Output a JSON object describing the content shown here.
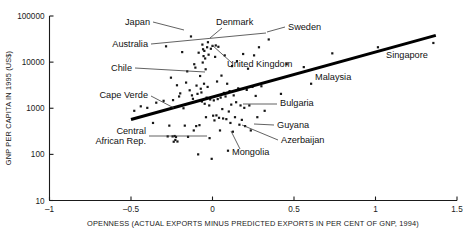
{
  "chart_data": {
    "type": "scatter",
    "title": "",
    "xlabel": "OPENNESS (ACTUAL EXPORTS MINUS PREDICTED EXPORTS IN PER CENT OF GNP, 1994)",
    "ylabel": "GNP PER CAPITA IN 1995 (US$)",
    "xlim": [
      -1,
      1.5
    ],
    "ylim": [
      10,
      100000
    ],
    "yscale": "log",
    "xscale": "linear",
    "grid": false,
    "legend": "none",
    "xticks": [
      -1,
      -0.5,
      0,
      0.5,
      1,
      1.5
    ],
    "xticklabels": [
      "–1",
      "–0.5",
      "0",
      "0.5",
      "1",
      "1.5"
    ],
    "yticks": [
      10,
      100,
      1000,
      10000,
      100000
    ],
    "yticklabels": [
      "10",
      "100",
      "1000",
      "10000",
      "100000"
    ],
    "trendline": {
      "x0": -0.5,
      "y0": 570,
      "x1": 1.37,
      "y1": 38000
    },
    "points": [
      {
        "x": -0.48,
        "y": 880
      },
      {
        "x": -0.44,
        "y": 1100
      },
      {
        "x": -0.4,
        "y": 1020
      },
      {
        "x": -0.365,
        "y": 480
      },
      {
        "x": -0.345,
        "y": 1320
      },
      {
        "x": -0.3,
        "y": 1450
      },
      {
        "x": -0.285,
        "y": 22000
      },
      {
        "x": -0.275,
        "y": 245
      },
      {
        "x": -0.265,
        "y": 420
      },
      {
        "x": -0.255,
        "y": 4600
      },
      {
        "x": -0.245,
        "y": 245
      },
      {
        "x": -0.242,
        "y": 1500
      },
      {
        "x": -0.238,
        "y": 188
      },
      {
        "x": -0.232,
        "y": 250
      },
      {
        "x": -0.228,
        "y": 205
      },
      {
        "x": -0.224,
        "y": 238
      },
      {
        "x": -0.218,
        "y": 3150
      },
      {
        "x": -0.215,
        "y": 190
      },
      {
        "x": -0.205,
        "y": 1800
      },
      {
        "x": -0.198,
        "y": 2100
      },
      {
        "x": -0.186,
        "y": 16500
      },
      {
        "x": -0.178,
        "y": 1000
      },
      {
        "x": -0.17,
        "y": 420
      },
      {
        "x": -0.162,
        "y": 3600
      },
      {
        "x": -0.155,
        "y": 6300
      },
      {
        "x": -0.15,
        "y": 240
      },
      {
        "x": -0.14,
        "y": 2450
      },
      {
        "x": -0.132,
        "y": 36000
      },
      {
        "x": -0.126,
        "y": 1900
      },
      {
        "x": -0.12,
        "y": 1600
      },
      {
        "x": -0.115,
        "y": 330
      },
      {
        "x": -0.112,
        "y": 9000
      },
      {
        "x": -0.105,
        "y": 7600
      },
      {
        "x": -0.1,
        "y": 410
      },
      {
        "x": -0.098,
        "y": 3100
      },
      {
        "x": -0.092,
        "y": 2050
      },
      {
        "x": -0.088,
        "y": 100
      },
      {
        "x": -0.085,
        "y": 16000
      },
      {
        "x": -0.08,
        "y": 430
      },
      {
        "x": -0.076,
        "y": 5000
      },
      {
        "x": -0.072,
        "y": 2650
      },
      {
        "x": -0.068,
        "y": 2200
      },
      {
        "x": -0.065,
        "y": 1400
      },
      {
        "x": -0.062,
        "y": 24000
      },
      {
        "x": -0.06,
        "y": 9800
      },
      {
        "x": -0.058,
        "y": 19000
      },
      {
        "x": -0.055,
        "y": 13500
      },
      {
        "x": -0.052,
        "y": 3400
      },
      {
        "x": -0.05,
        "y": 17500
      },
      {
        "x": -0.048,
        "y": 1250
      },
      {
        "x": -0.045,
        "y": 12000
      },
      {
        "x": -0.042,
        "y": 7000
      },
      {
        "x": -0.04,
        "y": 640
      },
      {
        "x": -0.036,
        "y": 1700
      },
      {
        "x": -0.033,
        "y": 21000
      },
      {
        "x": -0.03,
        "y": 2900
      },
      {
        "x": -0.028,
        "y": 27000
      },
      {
        "x": -0.024,
        "y": 14500
      },
      {
        "x": -0.02,
        "y": 1150
      },
      {
        "x": -0.018,
        "y": 225
      },
      {
        "x": -0.014,
        "y": 1550
      },
      {
        "x": -0.01,
        "y": 19500
      },
      {
        "x": -0.005,
        "y": 80
      },
      {
        "x": 0.0,
        "y": 22500
      },
      {
        "x": 0.004,
        "y": 690
      },
      {
        "x": 0.008,
        "y": 1480
      },
      {
        "x": 0.012,
        "y": 545
      },
      {
        "x": 0.016,
        "y": 13000
      },
      {
        "x": 0.02,
        "y": 23000
      },
      {
        "x": 0.024,
        "y": 700
      },
      {
        "x": 0.028,
        "y": 3800
      },
      {
        "x": 0.032,
        "y": 1580
      },
      {
        "x": 0.036,
        "y": 21500
      },
      {
        "x": 0.04,
        "y": 620
      },
      {
        "x": 0.046,
        "y": 330
      },
      {
        "x": 0.05,
        "y": 1700
      },
      {
        "x": 0.055,
        "y": 5100
      },
      {
        "x": 0.06,
        "y": 960
      },
      {
        "x": 0.065,
        "y": 600
      },
      {
        "x": 0.07,
        "y": 2150
      },
      {
        "x": 0.075,
        "y": 14000
      },
      {
        "x": 0.08,
        "y": 1800
      },
      {
        "x": 0.085,
        "y": 580
      },
      {
        "x": 0.09,
        "y": 3400
      },
      {
        "x": 0.095,
        "y": 120
      },
      {
        "x": 0.1,
        "y": 850
      },
      {
        "x": 0.105,
        "y": 2350
      },
      {
        "x": 0.11,
        "y": 480
      },
      {
        "x": 0.115,
        "y": 1200
      },
      {
        "x": 0.12,
        "y": 8200
      },
      {
        "x": 0.125,
        "y": 310
      },
      {
        "x": 0.13,
        "y": 1900
      },
      {
        "x": 0.138,
        "y": 640
      },
      {
        "x": 0.145,
        "y": 1350
      },
      {
        "x": 0.15,
        "y": 10500
      },
      {
        "x": 0.158,
        "y": 2700
      },
      {
        "x": 0.165,
        "y": 440
      },
      {
        "x": 0.172,
        "y": 1150
      },
      {
        "x": 0.18,
        "y": 560
      },
      {
        "x": 0.188,
        "y": 15000
      },
      {
        "x": 0.195,
        "y": 1020
      },
      {
        "x": 0.2,
        "y": 410
      },
      {
        "x": 0.21,
        "y": 2500
      },
      {
        "x": 0.218,
        "y": 7200
      },
      {
        "x": 0.226,
        "y": 1150
      },
      {
        "x": 0.235,
        "y": 330
      },
      {
        "x": 0.245,
        "y": 2900
      },
      {
        "x": 0.255,
        "y": 14000
      },
      {
        "x": 0.265,
        "y": 1850
      },
      {
        "x": 0.275,
        "y": 640
      },
      {
        "x": 0.285,
        "y": 21000
      },
      {
        "x": 0.3,
        "y": 3000
      },
      {
        "x": 0.32,
        "y": 880
      },
      {
        "x": 0.345,
        "y": 31000
      },
      {
        "x": 0.42,
        "y": 2050
      },
      {
        "x": 0.455,
        "y": 9000
      },
      {
        "x": 0.56,
        "y": 7800
      },
      {
        "x": 0.605,
        "y": 3400
      },
      {
        "x": 0.735,
        "y": 15500
      },
      {
        "x": 1.015,
        "y": 21000
      },
      {
        "x": 1.355,
        "y": 26000
      }
    ],
    "annotations": [
      {
        "label": "Japan",
        "text_x": 150,
        "text_y": 25,
        "anchor": "end",
        "leader": [
          [
            153,
            22
          ],
          [
            184,
            30
          ]
        ]
      },
      {
        "label": "Denmark",
        "text_x": 216,
        "text_y": 25,
        "anchor": "start",
        "leader": [
          [
            222,
            28
          ],
          [
            210,
            38
          ]
        ]
      },
      {
        "label": "Sweden",
        "text_x": 288,
        "text_y": 30,
        "anchor": "start",
        "leader": [
          [
            285,
            27
          ],
          [
            267,
            32
          ]
        ]
      },
      {
        "label": "Australia",
        "text_x": 148,
        "text_y": 47,
        "anchor": "end",
        "leader": [
          [
            151,
            44
          ],
          [
            266,
            33
          ]
        ]
      },
      {
        "label": "United Kingdom",
        "text_x": 227,
        "text_y": 67,
        "anchor": "start",
        "leader": [
          [
            232,
            63
          ],
          [
            212,
            45
          ]
        ]
      },
      {
        "label": "Chile",
        "text_x": 132,
        "text_y": 71,
        "anchor": "end",
        "leader": [
          [
            135,
            68
          ],
          [
            205,
            72
          ]
        ]
      },
      {
        "label": "Malaysia",
        "text_x": 315,
        "text_y": 80,
        "anchor": "start",
        "leader": null
      },
      {
        "label": "Cape Verde",
        "text_x": 148,
        "text_y": 98,
        "anchor": "end",
        "leader": [
          [
            151,
            96
          ],
          [
            174,
            108
          ]
        ]
      },
      {
        "label": "Bulgaria",
        "text_x": 280,
        "text_y": 106,
        "anchor": "start",
        "leader": [
          [
            277,
            104
          ],
          [
            243,
            104
          ]
        ]
      },
      {
        "label": "Guyana",
        "text_x": 277,
        "text_y": 128,
        "anchor": "start",
        "leader": [
          [
            274,
            125
          ],
          [
            254,
            124
          ]
        ]
      },
      {
        "label": "Azerbaijan",
        "text_x": 281,
        "text_y": 143,
        "anchor": "start",
        "leader": [
          [
            278,
            140
          ],
          [
            242,
            125
          ]
        ]
      },
      {
        "label": "Central",
        "text_x": 146,
        "text_y": 134,
        "anchor": "end",
        "leader": [
          [
            149,
            136
          ],
          [
            207,
            136
          ]
        ]
      },
      {
        "label": "African Rep.",
        "text_x": 146,
        "text_y": 144,
        "anchor": "end",
        "leader": null
      },
      {
        "label": "Mongolia",
        "text_x": 232,
        "text_y": 155,
        "anchor": "start",
        "leader": [
          [
            240,
            149
          ],
          [
            231,
            131
          ]
        ]
      },
      {
        "label": "Singapore",
        "text_x": 386,
        "text_y": 58,
        "anchor": "start",
        "leader": null
      }
    ]
  }
}
